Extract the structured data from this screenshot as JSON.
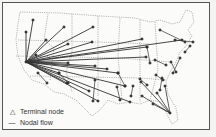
{
  "map": {
    "title": "",
    "region": "Contiguous United States",
    "colors": {
      "lines": "#333333",
      "borders": "#777777",
      "background": "#fbfbfa"
    },
    "hubs": [
      {
        "name": "west-hub",
        "x": 26,
        "y": 62
      },
      {
        "name": "florida-hub",
        "x": 170,
        "y": 113
      }
    ],
    "west_spokes": [
      [
        33,
        20
      ],
      [
        26,
        32
      ],
      [
        64,
        27
      ],
      [
        46,
        40
      ],
      [
        36,
        55
      ],
      [
        93,
        27
      ],
      [
        68,
        44
      ],
      [
        92,
        42
      ],
      [
        142,
        39
      ],
      [
        147,
        47
      ],
      [
        182,
        40
      ],
      [
        68,
        63
      ],
      [
        95,
        66
      ],
      [
        107,
        69
      ],
      [
        146,
        57
      ],
      [
        59,
        73
      ],
      [
        118,
        73
      ],
      [
        89,
        91
      ],
      [
        67,
        83
      ],
      [
        125,
        86
      ],
      [
        98,
        101
      ],
      [
        130,
        102
      ]
    ],
    "florida_spokes": [
      [
        141,
        82
      ],
      [
        157,
        93
      ],
      [
        153,
        104
      ],
      [
        142,
        96
      ],
      [
        165,
        86
      ]
    ],
    "other_links": [
      [
        [
          47,
          83
        ],
        [
          38,
          73
        ]
      ],
      [
        [
          59,
          73
        ],
        [
          68,
          83
        ]
      ],
      [
        [
          95,
          80
        ],
        [
          93,
          101
        ]
      ],
      [
        [
          160,
          30
        ],
        [
          185,
          42
        ]
      ],
      [
        [
          175,
          40
        ],
        [
          193,
          42
        ]
      ],
      [
        [
          185,
          52
        ],
        [
          190,
          46
        ]
      ],
      [
        [
          147,
          47
        ],
        [
          150,
          63
        ]
      ],
      [
        [
          155,
          60
        ],
        [
          166,
          65
        ]
      ],
      [
        [
          171,
          62
        ],
        [
          176,
          72
        ]
      ],
      [
        [
          173,
          73
        ],
        [
          180,
          58
        ]
      ],
      [
        [
          156,
          75
        ],
        [
          163,
          80
        ]
      ],
      [
        [
          118,
          73
        ],
        [
          125,
          86
        ]
      ],
      [
        [
          140,
          79
        ],
        [
          147,
          85
        ]
      ],
      [
        [
          133,
          86
        ],
        [
          131,
          96
        ]
      ],
      [
        [
          117,
          87
        ],
        [
          120,
          100
        ]
      ],
      [
        [
          160,
          90
        ],
        [
          162,
          78
        ]
      ]
    ]
  },
  "legend": {
    "items": [
      {
        "symbol": "△",
        "label": "Terminal node"
      },
      {
        "symbol": "—",
        "label": "Nodal flow"
      }
    ]
  }
}
